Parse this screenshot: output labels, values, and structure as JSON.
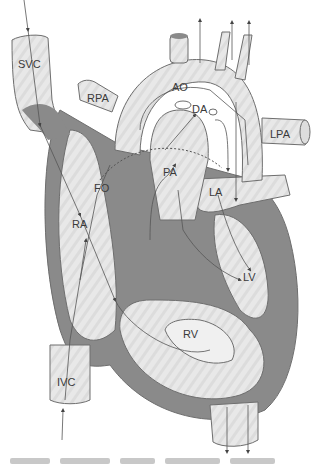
{
  "diagram": {
    "colors": {
      "background": "#ffffff",
      "vessel_fill": "#e6e6e6",
      "wall": "#8a8a8a",
      "outline": "#6e6e6e",
      "flow_line": "#555555",
      "label": "#3a3a3a"
    },
    "labels": {
      "svc": "SVC",
      "rpa": "RPA",
      "ao": "AO",
      "da": "DA",
      "lpa": "LPA",
      "pa": "PA",
      "la": "LA",
      "fo": "FO",
      "ra": "RA",
      "lv": "LV",
      "rv": "RV",
      "ivc": "IVC"
    },
    "caption_visible": "partial, cut off at bottom edge"
  }
}
